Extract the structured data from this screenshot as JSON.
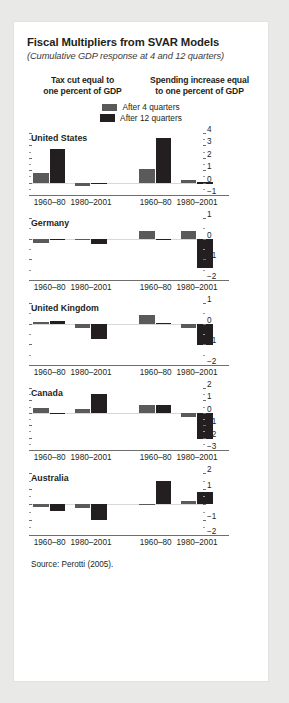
{
  "figure": {
    "title": "Fiscal Multipliers from SVAR Models",
    "subtitle": "(Cumulative GDP response at 4 and 12 quarters)",
    "column_headers": [
      "Tax cut equal to one percent of GDP",
      "Spending increase equal to one percent of GDP"
    ],
    "column_header_left_line1": "Tax cut equal to",
    "column_header_left_line2": "one percent of GDP",
    "column_header_right_line1": "Spending increase equal",
    "column_header_right_line2": "to one percent of GDP",
    "legend": [
      {
        "label": "After 4 quarters",
        "color": "#5a5a5a"
      },
      {
        "label": "After 12 quarters",
        "color": "#231f20"
      }
    ],
    "source": "Source: Perotti (2005)."
  },
  "chart_data": {
    "type": "bar",
    "title": "Fiscal Multipliers from SVAR Models",
    "subtitle": "(Cumulative GDP response at 4 and 12 quarters)",
    "xlabel": "",
    "ylabel": "",
    "grid": false,
    "legend_position": "top-center",
    "categories": [
      "1960–80",
      "1980–2001"
    ],
    "series_names": [
      "After 4 quarters",
      "After 12 quarters"
    ],
    "series_colors": [
      "#5a5a5a",
      "#231f20"
    ],
    "column_groups": [
      "Tax cut equal to one percent of GDP",
      "Spending increase equal to one percent of GDP"
    ],
    "panels": [
      {
        "name": "United States",
        "ylim": [
          -1,
          4
        ],
        "yticks": [
          4,
          3,
          2,
          1,
          0,
          -1
        ],
        "tax_cut": {
          "1960–80": {
            "after_4": 0.8,
            "after_12": 2.7
          },
          "1980–2001": {
            "after_4": -0.3,
            "after_12": -0.1
          }
        },
        "spending_increase": {
          "1960–80": {
            "after_4": 1.1,
            "after_12": 3.6
          },
          "1980–2001": {
            "after_4": 0.25,
            "after_12": 0.02
          }
        }
      },
      {
        "name": "Germany",
        "ylim": [
          -2,
          1
        ],
        "yticks": [
          1,
          0,
          -1,
          -2
        ],
        "tax_cut": {
          "1960–80": {
            "after_4": -0.2,
            "after_12": -0.05
          },
          "1980–2001": {
            "after_4": -0.02,
            "after_12": -0.28
          }
        },
        "spending_increase": {
          "1960–80": {
            "after_4": 0.35,
            "after_12": -0.08
          },
          "1980–2001": {
            "after_4": 0.35,
            "after_12": -1.4
          }
        }
      },
      {
        "name": "United Kingdom",
        "ylim": [
          -2,
          1
        ],
        "yticks": [
          1,
          0,
          -1,
          -2
        ],
        "tax_cut": {
          "1960–80": {
            "after_4": 0.08,
            "after_12": 0.12
          },
          "1980–2001": {
            "after_4": -0.2,
            "after_12": -0.75
          }
        },
        "spending_increase": {
          "1960–80": {
            "after_4": 0.4,
            "after_12": 0.03
          },
          "1980–2001": {
            "after_4": -0.2,
            "after_12": -1.05
          }
        }
      },
      {
        "name": "Canada",
        "ylim": [
          -3,
          2
        ],
        "yticks": [
          2,
          1,
          0,
          -1,
          -2,
          -3
        ],
        "tax_cut": {
          "1960–80": {
            "after_4": 0.35,
            "after_12": 0.0
          },
          "1980–2001": {
            "after_4": 0.3,
            "after_12": 1.5
          }
        },
        "spending_increase": {
          "1960–80": {
            "after_4": 0.6,
            "after_12": 0.65
          },
          "1980–2001": {
            "after_4": -0.3,
            "after_12": -2.15
          }
        }
      },
      {
        "name": "Australia",
        "ylim": [
          -2,
          2
        ],
        "yticks": [
          2,
          1,
          0,
          -1,
          -2
        ],
        "tax_cut": {
          "1960–80": {
            "after_4": -0.2,
            "after_12": -0.45
          },
          "1980–2001": {
            "after_4": -0.25,
            "after_12": -1.05
          }
        },
        "spending_increase": {
          "1960–80": {
            "after_4": -0.05,
            "after_12": 1.5
          },
          "1980–2001": {
            "after_4": 0.2,
            "after_12": 0.75
          }
        }
      }
    ]
  }
}
